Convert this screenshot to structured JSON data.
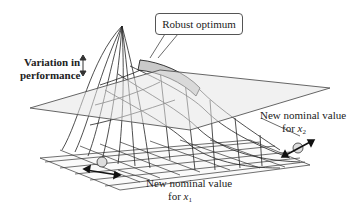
{
  "figure": {
    "labels": {
      "variation": "Variation in",
      "performance": "performance",
      "robust_optimum": "Robust optimum",
      "x2_line1": "New nominal value",
      "x2_line2_prefix": "for ",
      "x2_var": "x",
      "x2_sub": "2",
      "x1_line1": "New nominal value",
      "x1_line2_prefix": "for ",
      "x1_var": "x",
      "x1_sub": "1"
    },
    "colors": {
      "mesh": "#2a2a2a",
      "plane_fill": "#e9e9e9",
      "plane_stroke": "#555555",
      "highlight": "#bdbdbd"
    }
  }
}
